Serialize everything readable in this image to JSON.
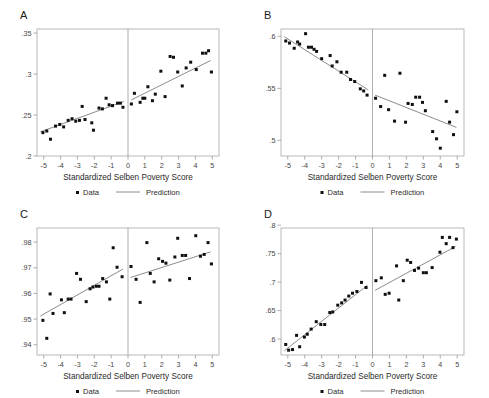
{
  "figure": {
    "width": 489,
    "height": 398,
    "background": "#ffffff",
    "point_color": "#101010",
    "line_color": "#6e6e6e",
    "frame_color": "#9a9a9a"
  },
  "common": {
    "xlabel": "Standardized Selben Poverty Score",
    "xticks": [
      "-5",
      "-4",
      "-3",
      "-2",
      "-1",
      "0",
      "1",
      "2",
      "3",
      "4",
      "5"
    ],
    "xlim": [
      -5.4,
      5.4
    ],
    "cutoff": 0,
    "legend": {
      "data_label": "Data",
      "prediction_label": "Prediction",
      "data_marker": "square-point-marker",
      "prediction_marker": "line-segment-marker"
    }
  },
  "chart_data": [
    {
      "panel": "A",
      "type": "scatter",
      "title": "A",
      "xlabel": "Standardized Selben Poverty Score",
      "ylabel": "",
      "ylim": [
        0.2,
        0.355
      ],
      "yticks": [
        ".2",
        ".25",
        ".3",
        ".35"
      ],
      "ytick_values": [
        0.2,
        0.25,
        0.3,
        0.35
      ],
      "xlim": [
        -5.4,
        5.4
      ],
      "grid": false,
      "legend_position": "below-axis",
      "cutoff_line": 0,
      "points_left": [
        {
          "x": -5.05,
          "y": 0.2285
        },
        {
          "x": -4.82,
          "y": 0.2305
        },
        {
          "x": -4.6,
          "y": 0.2205
        },
        {
          "x": -4.3,
          "y": 0.2365
        },
        {
          "x": -4.05,
          "y": 0.2385
        },
        {
          "x": -3.82,
          "y": 0.2355
        },
        {
          "x": -3.55,
          "y": 0.2435
        },
        {
          "x": -3.32,
          "y": 0.2455
        },
        {
          "x": -3.1,
          "y": 0.2425
        },
        {
          "x": -2.88,
          "y": 0.2435
        },
        {
          "x": -2.72,
          "y": 0.2605
        },
        {
          "x": -2.55,
          "y": 0.2445
        },
        {
          "x": -2.15,
          "y": 0.2405
        },
        {
          "x": -2.05,
          "y": 0.2315
        },
        {
          "x": -1.72,
          "y": 0.2585
        },
        {
          "x": -1.52,
          "y": 0.2575
        },
        {
          "x": -1.3,
          "y": 0.2705
        },
        {
          "x": -1.12,
          "y": 0.2625
        },
        {
          "x": -0.92,
          "y": 0.2615
        },
        {
          "x": -0.62,
          "y": 0.2645
        },
        {
          "x": -0.45,
          "y": 0.2645
        },
        {
          "x": -0.3,
          "y": 0.2595
        }
      ],
      "points_right": [
        {
          "x": 0.2,
          "y": 0.2635
        },
        {
          "x": 0.38,
          "y": 0.2765
        },
        {
          "x": 0.72,
          "y": 0.2655
        },
        {
          "x": 0.88,
          "y": 0.2705
        },
        {
          "x": 1.0,
          "y": 0.2705
        },
        {
          "x": 1.18,
          "y": 0.2845
        },
        {
          "x": 1.45,
          "y": 0.2675
        },
        {
          "x": 1.62,
          "y": 0.2755
        },
        {
          "x": 1.95,
          "y": 0.3035
        },
        {
          "x": 2.2,
          "y": 0.2725
        },
        {
          "x": 2.5,
          "y": 0.3215
        },
        {
          "x": 2.7,
          "y": 0.3205
        },
        {
          "x": 2.95,
          "y": 0.3025
        },
        {
          "x": 3.22,
          "y": 0.2855
        },
        {
          "x": 3.45,
          "y": 0.3075
        },
        {
          "x": 3.72,
          "y": 0.3145
        },
        {
          "x": 4.05,
          "y": 0.3055
        },
        {
          "x": 4.42,
          "y": 0.3255
        },
        {
          "x": 4.62,
          "y": 0.3255
        },
        {
          "x": 4.78,
          "y": 0.3285
        },
        {
          "x": 4.95,
          "y": 0.3025
        }
      ],
      "fit_left": {
        "x1": -5.2,
        "y1": 0.2295,
        "x2": -0.25,
        "y2": 0.2665
      },
      "fit_right": {
        "x1": 0.2,
        "y1": 0.2685,
        "x2": 4.9,
        "y2": 0.3165
      }
    },
    {
      "panel": "B",
      "type": "scatter",
      "title": "B",
      "xlabel": "Standardized Selben Poverty Score",
      "ylabel": "",
      "ylim": [
        0.485,
        0.607
      ],
      "yticks": [
        ".5",
        ".55",
        ".6"
      ],
      "ytick_values": [
        0.5,
        0.55,
        0.6
      ],
      "xlim": [
        -5.4,
        5.4
      ],
      "grid": false,
      "legend_position": "below-axis",
      "cutoff_line": 0,
      "points_left": [
        {
          "x": -5.12,
          "y": 0.5955
        },
        {
          "x": -4.9,
          "y": 0.5935
        },
        {
          "x": -4.62,
          "y": 0.5885
        },
        {
          "x": -4.42,
          "y": 0.5945
        },
        {
          "x": -4.3,
          "y": 0.5925
        },
        {
          "x": -3.95,
          "y": 0.6025
        },
        {
          "x": -3.78,
          "y": 0.5895
        },
        {
          "x": -3.6,
          "y": 0.5895
        },
        {
          "x": -3.45,
          "y": 0.5875
        },
        {
          "x": -3.3,
          "y": 0.5855
        },
        {
          "x": -3.0,
          "y": 0.5785
        },
        {
          "x": -2.5,
          "y": 0.5815
        },
        {
          "x": -2.38,
          "y": 0.5715
        },
        {
          "x": -2.1,
          "y": 0.5755
        },
        {
          "x": -1.85,
          "y": 0.5655
        },
        {
          "x": -1.52,
          "y": 0.5655
        },
        {
          "x": -1.3,
          "y": 0.5585
        },
        {
          "x": -1.05,
          "y": 0.5565
        },
        {
          "x": -0.72,
          "y": 0.5495
        },
        {
          "x": -0.52,
          "y": 0.5475
        },
        {
          "x": -0.32,
          "y": 0.5435
        }
      ],
      "points_right": [
        {
          "x": 0.18,
          "y": 0.5405
        },
        {
          "x": 0.48,
          "y": 0.5325
        },
        {
          "x": 0.72,
          "y": 0.5625
        },
        {
          "x": 0.95,
          "y": 0.5295
        },
        {
          "x": 1.3,
          "y": 0.5185
        },
        {
          "x": 1.62,
          "y": 0.5645
        },
        {
          "x": 1.95,
          "y": 0.5175
        },
        {
          "x": 2.1,
          "y": 0.5355
        },
        {
          "x": 2.35,
          "y": 0.5345
        },
        {
          "x": 2.55,
          "y": 0.5415
        },
        {
          "x": 2.78,
          "y": 0.5415
        },
        {
          "x": 2.95,
          "y": 0.5365
        },
        {
          "x": 3.12,
          "y": 0.5285
        },
        {
          "x": 3.55,
          "y": 0.5085
        },
        {
          "x": 3.78,
          "y": 0.5015
        },
        {
          "x": 4.0,
          "y": 0.4925
        },
        {
          "x": 4.35,
          "y": 0.5375
        },
        {
          "x": 4.55,
          "y": 0.5175
        },
        {
          "x": 4.78,
          "y": 0.5055
        },
        {
          "x": 4.98,
          "y": 0.5275
        }
      ],
      "fit_left": {
        "x1": -5.2,
        "y1": 0.5995,
        "x2": -0.25,
        "y2": 0.5485
      },
      "fit_right": {
        "x1": 0.15,
        "y1": 0.5435,
        "x2": 4.95,
        "y2": 0.5125
      }
    },
    {
      "panel": "C",
      "type": "scatter",
      "title": "C",
      "xlabel": "Standardized Selben Poverty Score",
      "ylabel": "",
      "ylim": [
        0.936,
        0.9855
      ],
      "yticks": [
        ".94",
        ".95",
        ".96",
        ".97",
        ".98"
      ],
      "ytick_values": [
        0.94,
        0.95,
        0.96,
        0.97,
        0.98
      ],
      "xlim": [
        -5.4,
        5.4
      ],
      "grid": false,
      "legend_position": "below-axis",
      "cutoff_line": 0,
      "points_left": [
        {
          "x": -5.05,
          "y": 0.9495
        },
        {
          "x": -4.82,
          "y": 0.9425
        },
        {
          "x": -4.62,
          "y": 0.9598
        },
        {
          "x": -4.45,
          "y": 0.9522
        },
        {
          "x": -3.95,
          "y": 0.9575
        },
        {
          "x": -3.78,
          "y": 0.9525
        },
        {
          "x": -3.55,
          "y": 0.9578
        },
        {
          "x": -3.38,
          "y": 0.9578
        },
        {
          "x": -3.05,
          "y": 0.9678
        },
        {
          "x": -2.82,
          "y": 0.9655
        },
        {
          "x": -2.48,
          "y": 0.9568
        },
        {
          "x": -2.25,
          "y": 0.9618
        },
        {
          "x": -2.08,
          "y": 0.9625
        },
        {
          "x": -1.88,
          "y": 0.9628
        },
        {
          "x": -1.72,
          "y": 0.9628
        },
        {
          "x": -1.5,
          "y": 0.9658
        },
        {
          "x": -1.28,
          "y": 0.9645
        },
        {
          "x": -1.08,
          "y": 0.9578
        },
        {
          "x": -0.88,
          "y": 0.9778
        },
        {
          "x": -0.65,
          "y": 0.9702
        },
        {
          "x": -0.35,
          "y": 0.9665
        }
      ],
      "points_right": [
        {
          "x": 0.18,
          "y": 0.9705
        },
        {
          "x": 0.48,
          "y": 0.9655
        },
        {
          "x": 0.72,
          "y": 0.9565
        },
        {
          "x": 1.12,
          "y": 0.9798
        },
        {
          "x": 1.32,
          "y": 0.9678
        },
        {
          "x": 1.55,
          "y": 0.9645
        },
        {
          "x": 1.82,
          "y": 0.9735
        },
        {
          "x": 2.05,
          "y": 0.9725
        },
        {
          "x": 2.25,
          "y": 0.9718
        },
        {
          "x": 2.48,
          "y": 0.9652
        },
        {
          "x": 2.78,
          "y": 0.9742
        },
        {
          "x": 2.95,
          "y": 0.9815
        },
        {
          "x": 3.22,
          "y": 0.9748
        },
        {
          "x": 3.42,
          "y": 0.9748
        },
        {
          "x": 3.65,
          "y": 0.9658
        },
        {
          "x": 4.02,
          "y": 0.9825
        },
        {
          "x": 4.3,
          "y": 0.9745
        },
        {
          "x": 4.52,
          "y": 0.9752
        },
        {
          "x": 4.75,
          "y": 0.9798
        },
        {
          "x": 4.95,
          "y": 0.9715
        }
      ],
      "fit_left": {
        "x1": -5.2,
        "y1": 0.9512,
        "x2": -0.3,
        "y2": 0.9695
      },
      "fit_right": {
        "x1": 0.15,
        "y1": 0.9662,
        "x2": 4.9,
        "y2": 0.9762
      }
    },
    {
      "panel": "D",
      "type": "scatter",
      "title": "D",
      "xlabel": "Standardized Selben Poverty Score",
      "ylabel": "",
      "ylim": [
        0.572,
        0.795
      ],
      "yticks": [
        ".6",
        ".65",
        ".7",
        ".75",
        ".8"
      ],
      "ytick_values": [
        0.6,
        0.65,
        0.7,
        0.75,
        0.8
      ],
      "xlim": [
        -5.4,
        5.4
      ],
      "grid": false,
      "legend_position": "below-axis",
      "cutoff_line": 0,
      "points_left": [
        {
          "x": -5.12,
          "y": 0.5905
        },
        {
          "x": -4.95,
          "y": 0.5805
        },
        {
          "x": -4.72,
          "y": 0.5815
        },
        {
          "x": -4.48,
          "y": 0.6065
        },
        {
          "x": -4.3,
          "y": 0.5865
        },
        {
          "x": -4.02,
          "y": 0.6035
        },
        {
          "x": -3.85,
          "y": 0.6085
        },
        {
          "x": -3.62,
          "y": 0.6175
        },
        {
          "x": -3.32,
          "y": 0.6305
        },
        {
          "x": -3.05,
          "y": 0.6255
        },
        {
          "x": -2.82,
          "y": 0.6255
        },
        {
          "x": -2.52,
          "y": 0.6465
        },
        {
          "x": -2.35,
          "y": 0.6475
        },
        {
          "x": -2.05,
          "y": 0.6595
        },
        {
          "x": -1.82,
          "y": 0.6635
        },
        {
          "x": -1.62,
          "y": 0.6685
        },
        {
          "x": -1.4,
          "y": 0.6755
        },
        {
          "x": -1.18,
          "y": 0.6805
        },
        {
          "x": -0.92,
          "y": 0.6835
        },
        {
          "x": -0.65,
          "y": 0.6995
        },
        {
          "x": -0.38,
          "y": 0.6905
        }
      ],
      "points_right": [
        {
          "x": 0.2,
          "y": 0.7025
        },
        {
          "x": 0.52,
          "y": 0.7075
        },
        {
          "x": 0.75,
          "y": 0.6785
        },
        {
          "x": 0.98,
          "y": 0.6805
        },
        {
          "x": 1.42,
          "y": 0.7285
        },
        {
          "x": 1.55,
          "y": 0.6685
        },
        {
          "x": 1.82,
          "y": 0.7025
        },
        {
          "x": 2.05,
          "y": 0.7385
        },
        {
          "x": 2.25,
          "y": 0.7345
        },
        {
          "x": 2.48,
          "y": 0.7205
        },
        {
          "x": 2.72,
          "y": 0.7245
        },
        {
          "x": 3.0,
          "y": 0.7165
        },
        {
          "x": 3.18,
          "y": 0.7165
        },
        {
          "x": 3.52,
          "y": 0.7255
        },
        {
          "x": 3.98,
          "y": 0.7525
        },
        {
          "x": 4.12,
          "y": 0.7785
        },
        {
          "x": 4.35,
          "y": 0.7675
        },
        {
          "x": 4.55,
          "y": 0.7785
        },
        {
          "x": 4.75,
          "y": 0.7605
        },
        {
          "x": 4.95,
          "y": 0.7755
        }
      ],
      "fit_left": {
        "x1": -5.2,
        "y1": 0.5795,
        "x2": -0.3,
        "y2": 0.6945
      },
      "fit_right": {
        "x1": 0.15,
        "y1": 0.6855,
        "x2": 4.9,
        "y2": 0.7625
      }
    }
  ]
}
